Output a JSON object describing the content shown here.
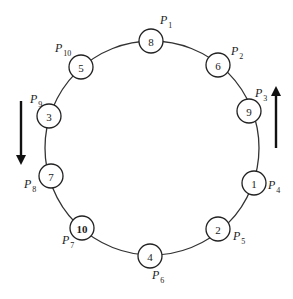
{
  "diagram": {
    "type": "ring",
    "ring": {
      "cx": 152,
      "cy": 148,
      "r": 107
    },
    "shade_color": "#9a9a9a",
    "nodes": [
      {
        "value": "8",
        "position": "P",
        "index": "1",
        "cx": 151,
        "cy": 41,
        "lx": 160,
        "ly": 24,
        "shaded": false
      },
      {
        "value": "6",
        "position": "P",
        "index": "2",
        "cx": 218,
        "cy": 65,
        "lx": 231,
        "ly": 55,
        "shaded": false
      },
      {
        "value": "9",
        "position": "P",
        "index": "3",
        "cx": 249,
        "cy": 111,
        "lx": 255,
        "ly": 97,
        "shaded": false
      },
      {
        "value": "1",
        "position": "P",
        "index": "4",
        "cx": 254,
        "cy": 183,
        "lx": 268,
        "ly": 189,
        "shaded": false
      },
      {
        "value": "2",
        "position": "P",
        "index": "5",
        "cx": 218,
        "cy": 229,
        "lx": 233,
        "ly": 240,
        "shaded": false
      },
      {
        "value": "4",
        "position": "P",
        "index": "6",
        "cx": 150,
        "cy": 256,
        "lx": 152,
        "ly": 279,
        "shaded": false
      },
      {
        "value": "10",
        "position": "P",
        "index": "7",
        "cx": 82,
        "cy": 228,
        "lx": 62,
        "ly": 244,
        "shaded": true
      },
      {
        "value": "7",
        "position": "P",
        "index": "8",
        "cx": 51,
        "cy": 176,
        "lx": 24,
        "ly": 188,
        "shaded": false
      },
      {
        "value": "3",
        "position": "P",
        "index": "9",
        "cx": 49,
        "cy": 116,
        "lx": 30,
        "ly": 103,
        "shaded": false
      },
      {
        "value": "5",
        "position": "P",
        "index": "10",
        "cx": 81,
        "cy": 67,
        "lx": 55,
        "ly": 52,
        "shaded": false
      }
    ],
    "arrows": [
      {
        "direction": "down",
        "x": 21,
        "y1": 101,
        "y2": 165
      },
      {
        "direction": "up",
        "x": 276,
        "y1": 148,
        "y2": 86
      }
    ]
  }
}
